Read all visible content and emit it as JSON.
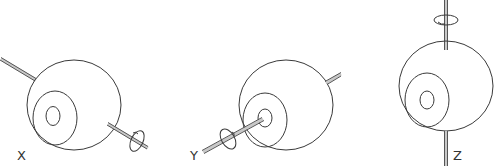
{
  "diagram": {
    "panels": [
      {
        "id": "x",
        "label": "X",
        "axis": "x-axis rotation"
      },
      {
        "id": "y",
        "label": "Y",
        "axis": "y-axis rotation"
      },
      {
        "id": "z",
        "label": "Z",
        "axis": "z-axis rotation"
      }
    ],
    "colors": {
      "line": "#3a3a3a",
      "rod": "#c8c8c8",
      "background": "#ffffff"
    }
  }
}
